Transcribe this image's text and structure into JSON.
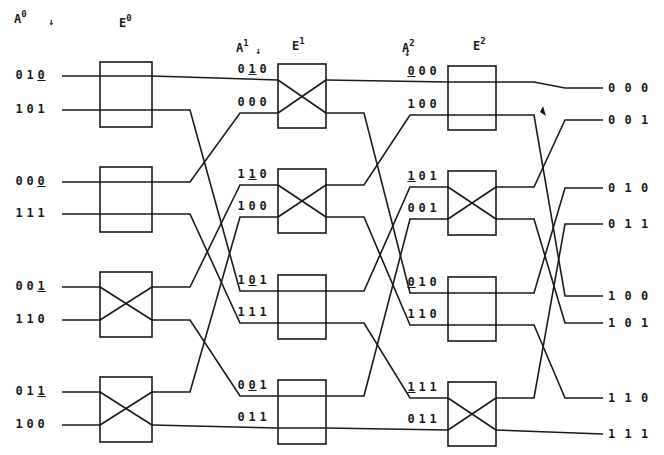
{
  "headers": {
    "a0": {
      "base": "A",
      "sup": "0"
    },
    "e0": {
      "base": "E",
      "sup": "0"
    },
    "a1": {
      "base": "A",
      "sup": "1"
    },
    "e1": {
      "base": "E",
      "sup": "1"
    },
    "a2": {
      "base": "A",
      "sup": "2"
    },
    "e2": {
      "base": "E",
      "sup": "2"
    },
    "arrow": "↓"
  },
  "stage0_inputs": [
    {
      "bits": [
        "0",
        "1",
        "0"
      ],
      "underline": 2
    },
    {
      "bits": [
        "1",
        "0",
        "1"
      ],
      "underline": -1
    },
    {
      "bits": [
        "0",
        "0",
        "0"
      ],
      "underline": 2
    },
    {
      "bits": [
        "1",
        "1",
        "1"
      ],
      "underline": -1
    },
    {
      "bits": [
        "0",
        "0",
        "1"
      ],
      "underline": 2
    },
    {
      "bits": [
        "1",
        "1",
        "0"
      ],
      "underline": -1
    },
    {
      "bits": [
        "0",
        "1",
        "1"
      ],
      "underline": 2
    },
    {
      "bits": [
        "1",
        "0",
        "0"
      ],
      "underline": -1
    }
  ],
  "stage1_inputs": [
    {
      "bits": [
        "0",
        "1",
        "0"
      ],
      "underline": 1
    },
    {
      "bits": [
        "0",
        "0",
        "0"
      ],
      "underline": -1
    },
    {
      "bits": [
        "1",
        "1",
        "0"
      ],
      "underline": 1
    },
    {
      "bits": [
        "1",
        "0",
        "0"
      ],
      "underline": -1
    },
    {
      "bits": [
        "1",
        "0",
        "1"
      ],
      "underline": 1
    },
    {
      "bits": [
        "1",
        "1",
        "1"
      ],
      "underline": -1
    },
    {
      "bits": [
        "0",
        "0",
        "1"
      ],
      "underline": 1
    },
    {
      "bits": [
        "0",
        "1",
        "1"
      ],
      "underline": -1
    }
  ],
  "stage2_inputs": [
    {
      "bits": [
        "0",
        "0",
        "0"
      ],
      "underline": 0
    },
    {
      "bits": [
        "1",
        "0",
        "0"
      ],
      "underline": -1
    },
    {
      "bits": [
        "1",
        "0",
        "1"
      ],
      "underline": 0
    },
    {
      "bits": [
        "0",
        "0",
        "1"
      ],
      "underline": -1
    },
    {
      "bits": [
        "0",
        "1",
        "0"
      ],
      "underline": 0
    },
    {
      "bits": [
        "1",
        "1",
        "0"
      ],
      "underline": -1
    },
    {
      "bits": [
        "1",
        "1",
        "1"
      ],
      "underline": 0
    },
    {
      "bits": [
        "0",
        "1",
        "1"
      ],
      "underline": -1
    }
  ],
  "outputs": [
    "0 0 0",
    "0 0 1",
    "0 1 0",
    "0 1 1",
    "1 0 0",
    "1 0 1",
    "1 1 0",
    "1 1 1"
  ],
  "switch_states": {
    "stage0": [
      "straight",
      "straight",
      "cross",
      "cross"
    ],
    "stage1": [
      "cross",
      "cross",
      "straight",
      "straight"
    ],
    "stage2": [
      "straight",
      "cross",
      "straight",
      "cross"
    ]
  },
  "interconnect": {
    "shuffle": [
      0,
      4,
      1,
      5,
      2,
      6,
      3,
      7
    ]
  },
  "colors": {
    "ink": "#1a1a1a",
    "background": "#ffffff"
  }
}
